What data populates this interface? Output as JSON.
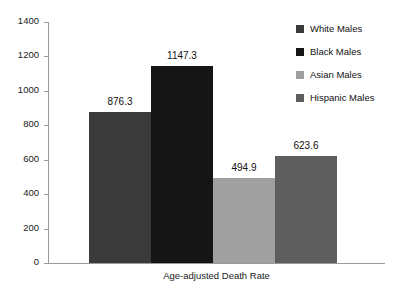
{
  "chart_data": {
    "type": "bar",
    "title": "",
    "subtitle": "",
    "xlabel": "Age-adjusted Death Rate",
    "ylabel": "",
    "categories": [
      "White Males",
      "Black Males",
      "Asian Males",
      "Hispanic Males"
    ],
    "values": [
      876.3,
      494.9,
      1147.3,
      623.6
    ],
    "bars": [
      {
        "label": "White Males",
        "value": 876.3,
        "value_text": "876.3",
        "color": "#3a3a3a"
      },
      {
        "label": "Black Males",
        "value": 1147.3,
        "value_text": "1147.3",
        "color": "#151515"
      },
      {
        "label": "Asian Males",
        "value": 494.9,
        "value_text": "494.9",
        "color": "#a0a0a0"
      },
      {
        "label": "Hispanic Males",
        "value": 623.6,
        "value_text": "623.6",
        "color": "#5e5e5e"
      }
    ],
    "ylim": [
      0,
      1400
    ],
    "yticks": [
      0,
      200,
      400,
      600,
      800,
      1000,
      1200,
      1400
    ],
    "ytick_labels": [
      "0",
      "200",
      "400",
      "600",
      "800",
      "1000",
      "1200",
      "1400"
    ],
    "grid": false,
    "legend_position": "top-right",
    "legend": [
      {
        "label": "White Males",
        "color": "#3a3a3a"
      },
      {
        "label": "Black Males",
        "color": "#151515"
      },
      {
        "label": "Asian Males",
        "color": "#a0a0a0"
      },
      {
        "label": "Hispanic Males",
        "color": "#5e5e5e"
      }
    ],
    "axis_color": "#9a9a9a",
    "background": "#ffffff"
  }
}
